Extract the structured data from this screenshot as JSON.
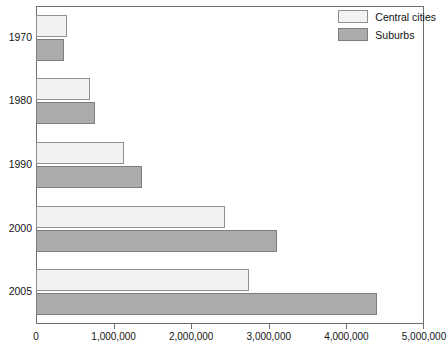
{
  "chart_data": {
    "type": "bar",
    "orientation": "horizontal",
    "title": "",
    "xlabel": "",
    "ylabel": "",
    "categories": [
      "1970",
      "1980",
      "1990",
      "2000",
      "2005"
    ],
    "series": [
      {
        "name": "Central cities",
        "color": "#f2f2f2",
        "border": "#909090",
        "values": [
          400000,
          690000,
          1130000,
          2440000,
          2740000
        ]
      },
      {
        "name": "Suburbs",
        "color": "#ababab",
        "border": "#7d7d7d",
        "values": [
          365000,
          760000,
          1360000,
          3110000,
          4400000
        ]
      }
    ],
    "xlim": [
      0,
      5000000
    ],
    "xticks": [
      0,
      1000000,
      2000000,
      3000000,
      4000000,
      5000000
    ],
    "xtick_labels": [
      "0",
      "1,000,000",
      "2,000,000",
      "3,000,000",
      "4,000,000",
      "5,000,000"
    ],
    "grid": false,
    "legend_position": "top-right",
    "legend_entries": [
      "Central cities",
      "Suburbs"
    ]
  },
  "axes": {
    "y_tick_labels": [
      "1970",
      "1980",
      "1990",
      "2000",
      "2005"
    ],
    "x_tick_labels": [
      "0",
      "1,000,000",
      "2,000,000",
      "3,000,000",
      "4,000,000",
      "5,000,000"
    ]
  },
  "legend": {
    "items": [
      {
        "label": "Central cities",
        "swatch": "legend-swatch-central-cities"
      },
      {
        "label": "Suburbs",
        "swatch": "legend-swatch-suburbs"
      }
    ]
  }
}
